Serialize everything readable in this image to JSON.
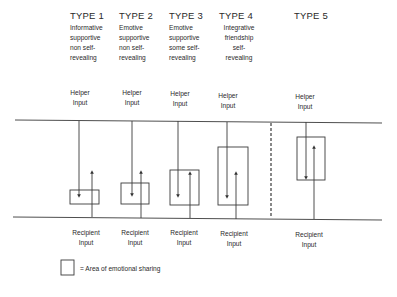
{
  "types": [
    {
      "title": "TYPE 1",
      "desc": [
        "Informative",
        "supportive",
        "non self-",
        "revealing"
      ]
    },
    {
      "title": "TYPE 2",
      "desc": [
        "Emotive",
        "supportive",
        "non self-",
        "revealing"
      ]
    },
    {
      "title": "TYPE 3",
      "desc": [
        "Emotive",
        "supportive",
        "some self-",
        "revealing"
      ]
    },
    {
      "title": "TYPE 4",
      "desc": [
        "Integrative",
        "friendship",
        "self-",
        "revealing"
      ]
    },
    {
      "title": "TYPE 5",
      "desc": []
    }
  ],
  "labels": {
    "helper": [
      "Helper",
      "Input"
    ],
    "recipient": [
      "Recipient",
      "Input"
    ]
  },
  "legend": {
    "text": "= Area of emotional sharing"
  },
  "geometry": {
    "top_line_y": 120,
    "bottom_line_y": 217,
    "divider_x": 271,
    "boxes": [
      {
        "type": "TYPE 1",
        "x": 70,
        "y": 190,
        "w": 29,
        "h": 14
      },
      {
        "type": "TYPE 2",
        "x": 121,
        "y": 183,
        "w": 28,
        "h": 21
      },
      {
        "type": "TYPE 3",
        "x": 170,
        "y": 170,
        "w": 29,
        "h": 35
      },
      {
        "type": "TYPE 4",
        "x": 218,
        "y": 147,
        "w": 30,
        "h": 58
      },
      {
        "type": "TYPE 5",
        "x": 297,
        "y": 137,
        "w": 28,
        "h": 43
      }
    ]
  }
}
